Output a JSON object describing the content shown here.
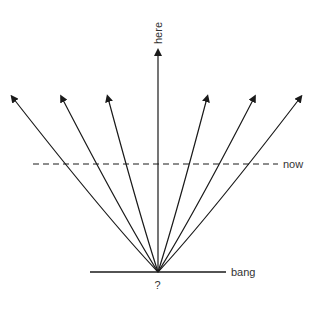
{
  "diagram": {
    "labels": {
      "top": "here",
      "dashed_line": "now",
      "baseline": "bang",
      "origin": "?"
    },
    "colors": {
      "stroke": "#1a1a1a",
      "text": "#333333",
      "background": "#ffffff"
    },
    "origin": {
      "x": 158,
      "y": 272
    },
    "baseline": {
      "x1": 90,
      "x2": 226,
      "y": 272
    },
    "now_line": {
      "x1": 33,
      "x2": 278,
      "y": 164,
      "style": "dashed"
    },
    "vertical_arrow_tip": {
      "x": 158,
      "y": 50
    },
    "curved_arrows": [
      {
        "side": "left",
        "tip_x": 13,
        "tip_y": 98
      },
      {
        "side": "left",
        "tip_x": 62,
        "tip_y": 98
      },
      {
        "side": "left",
        "tip_x": 108,
        "tip_y": 98
      },
      {
        "side": "right",
        "tip_x": 207,
        "tip_y": 98
      },
      {
        "side": "right",
        "tip_x": 254,
        "tip_y": 98
      },
      {
        "side": "right",
        "tip_x": 300,
        "tip_y": 98
      }
    ]
  }
}
